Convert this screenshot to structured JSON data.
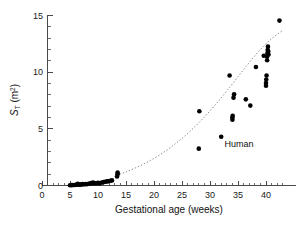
{
  "chart_data": {
    "type": "scatter",
    "title": "",
    "xlabel": "Gestational age (weeks)",
    "ylabel": "S_T (m2)",
    "ylabel_parts": {
      "symbol": "S",
      "subscript": "T",
      "units_open": " (m",
      "superscript": "2",
      "units_close": ")"
    },
    "xlim": [
      0,
      43.5
    ],
    "ylim": [
      0,
      15.6
    ],
    "grid": false,
    "legend": "none",
    "xticks": [
      0,
      5,
      10,
      15,
      20,
      25,
      30,
      35,
      40
    ],
    "xticklabels": [
      "0",
      "5",
      "10",
      "15",
      "20",
      "25",
      "30",
      "35",
      "40"
    ],
    "x_minor_step": 1,
    "yticks": [
      0,
      5,
      10,
      15
    ],
    "yticklabels": [
      "0",
      "5",
      "10",
      "15"
    ],
    "y_minor_step": 1,
    "annotations": [
      {
        "text": "Human",
        "x": 35.2,
        "y": 3.4
      }
    ],
    "series": [
      {
        "name": "Human placental surface area",
        "marker": "filled-circle",
        "color": "#000000",
        "points": [
          [
            5.0,
            0.02
          ],
          [
            5.3,
            0.03
          ],
          [
            5.6,
            0.04
          ],
          [
            5.9,
            0.05
          ],
          [
            6.1,
            0.06
          ],
          [
            6.3,
            0.1
          ],
          [
            6.4,
            0.14
          ],
          [
            6.6,
            0.08
          ],
          [
            6.8,
            0.06
          ],
          [
            7.0,
            0.09
          ],
          [
            7.2,
            0.12
          ],
          [
            7.5,
            0.1
          ],
          [
            7.8,
            0.13
          ],
          [
            8.0,
            0.11
          ],
          [
            8.3,
            0.15
          ],
          [
            8.6,
            0.17
          ],
          [
            8.8,
            0.22
          ],
          [
            9.0,
            0.19
          ],
          [
            9.1,
            0.26
          ],
          [
            9.3,
            0.21
          ],
          [
            9.5,
            0.17
          ],
          [
            9.8,
            0.2
          ],
          [
            10.0,
            0.24
          ],
          [
            10.2,
            0.18
          ],
          [
            10.4,
            0.22
          ],
          [
            10.7,
            0.27
          ],
          [
            11.0,
            0.3
          ],
          [
            11.3,
            0.33
          ],
          [
            11.6,
            0.36
          ],
          [
            11.9,
            0.38
          ],
          [
            12.2,
            0.42
          ],
          [
            12.5,
            0.45
          ],
          [
            13.4,
            0.8
          ],
          [
            13.5,
            1.0
          ],
          [
            13.5,
            1.15
          ],
          [
            28.0,
            3.25
          ],
          [
            28.1,
            6.55
          ],
          [
            32.0,
            4.3
          ],
          [
            33.5,
            9.7
          ],
          [
            34.0,
            5.8
          ],
          [
            34.0,
            6.0
          ],
          [
            34.05,
            6.15
          ],
          [
            34.2,
            7.75
          ],
          [
            34.3,
            8.05
          ],
          [
            36.4,
            7.6
          ],
          [
            37.2,
            7.05
          ],
          [
            38.2,
            10.45
          ],
          [
            39.6,
            11.45
          ],
          [
            40.0,
            8.8
          ],
          [
            40.0,
            9.05
          ],
          [
            40.05,
            9.35
          ],
          [
            40.1,
            9.7
          ],
          [
            40.2,
            11.05
          ],
          [
            40.2,
            11.35
          ],
          [
            40.25,
            11.65
          ],
          [
            40.3,
            11.95
          ],
          [
            40.35,
            12.25
          ],
          [
            40.4,
            11.85
          ],
          [
            40.45,
            11.55
          ],
          [
            42.4,
            14.55
          ]
        ]
      }
    ],
    "fit_curve": {
      "name": "fitted exponential trend",
      "style": "dotted",
      "color": "#8c8c8c",
      "x_range": [
        13.3,
        43.0
      ],
      "points": [
        [
          13.3,
          0.9
        ],
        [
          15.0,
          1.2
        ],
        [
          17.0,
          1.62
        ],
        [
          19.0,
          2.12
        ],
        [
          21.0,
          2.7
        ],
        [
          23.0,
          3.38
        ],
        [
          25.0,
          4.16
        ],
        [
          27.0,
          5.05
        ],
        [
          29.0,
          6.05
        ],
        [
          31.0,
          7.15
        ],
        [
          33.0,
          8.35
        ],
        [
          35.0,
          9.6
        ],
        [
          37.0,
          10.85
        ],
        [
          39.0,
          12.0
        ],
        [
          41.0,
          12.95
        ],
        [
          43.0,
          13.7
        ]
      ]
    }
  },
  "axes": {
    "x_title": "Gestational age (weeks)",
    "y_title_symbol": "S",
    "y_title_sub": "T",
    "y_title_units": "(m",
    "y_title_sup": "2",
    "y_title_close": ")"
  }
}
